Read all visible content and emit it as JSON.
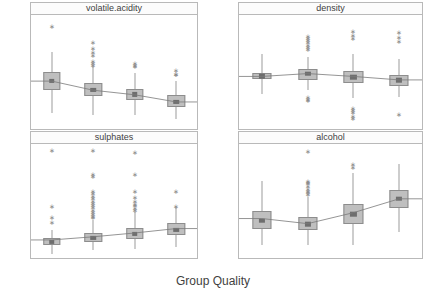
{
  "chart_data": {
    "type": "box",
    "title": "",
    "xlabel": "Group Quality",
    "ylabel": "",
    "grid": false,
    "legend": "none",
    "layout": "2x2 trellis panels",
    "categories": [
      "1",
      "2",
      "3",
      "4"
    ],
    "panels": [
      {
        "name": "volatile.acidity",
        "position": "top-left",
        "ylim": [
          0.0,
          1.75
        ],
        "yticks": [
          "1.6",
          "1.2",
          "0.8",
          "0.4",
          "0.0"
        ],
        "ytickvals": [
          1.6,
          1.2,
          0.8,
          0.4,
          0.0
        ],
        "boxes": [
          {
            "category": "1",
            "min": 0.25,
            "q1": 0.6,
            "median": 0.74,
            "q3": 0.88,
            "max": 1.18,
            "mean": 0.735,
            "outliers": [
              1.58
            ]
          },
          {
            "category": "2",
            "min": 0.22,
            "q1": 0.5,
            "median": 0.6,
            "q3": 0.7,
            "max": 0.96,
            "mean": 0.595,
            "outliers": [
              1.33,
              1.24,
              1.18,
              1.13,
              1.04,
              1.01,
              0.99
            ]
          },
          {
            "category": "3",
            "min": 0.21,
            "q1": 0.45,
            "median": 0.53,
            "q3": 0.62,
            "max": 0.86,
            "mean": 0.525,
            "outliers": [
              1.02,
              0.99,
              0.97
            ]
          },
          {
            "category": "4",
            "min": 0.16,
            "q1": 0.34,
            "median": 0.42,
            "q3": 0.52,
            "max": 0.74,
            "mean": 0.415,
            "outliers": [
              0.91,
              0.85,
              0.84
            ]
          }
        ]
      },
      {
        "name": "density",
        "position": "top-right",
        "ylim": [
          0.9885,
          1.0065
        ],
        "yticks": [
          "1.005",
          "1.000",
          "0.995",
          "0.990"
        ],
        "ytickvals": [
          1.005,
          1.0,
          0.995,
          0.99
        ],
        "boxes": [
          {
            "category": "1",
            "min": 0.99395,
            "q1": 0.9964,
            "median": 0.9968,
            "q3": 0.9974,
            "max": 1.0004,
            "mean": 0.9968,
            "outliers": []
          },
          {
            "category": "2",
            "min": 0.9946,
            "q1": 0.9962,
            "median": 0.99725,
            "q3": 0.9979,
            "max": 0.9998,
            "mean": 0.99725,
            "outliers": [
              1.0032,
              1.0029,
              1.0026,
              1.0022,
              1.0018,
              1.0015,
              1.0012,
              0.9935,
              0.9933,
              0.9931
            ]
          },
          {
            "category": "3",
            "min": 0.9934,
            "q1": 0.9958,
            "median": 0.9967,
            "q3": 0.9977,
            "max": 1.0004,
            "mean": 0.9968,
            "outliers": [
              1.004,
              1.0034,
              1.0029,
              0.9918,
              0.9915,
              0.9912,
              0.9906,
              0.9903
            ]
          },
          {
            "category": "4",
            "min": 0.9935,
            "q1": 0.9953,
            "median": 0.9962,
            "q3": 0.9971,
            "max": 0.9996,
            "mean": 0.99625,
            "outliers": [
              1.0038,
              1.0031,
              1.0024,
              0.9908
            ]
          }
        ]
      },
      {
        "name": "sulphates",
        "position": "bottom-left",
        "ylim": [
          0.3,
          2.1
        ],
        "yticks": [
          "2.0",
          "1.5",
          "1.0",
          "0.5"
        ],
        "ytickvals": [
          2.0,
          1.5,
          1.0,
          0.5
        ],
        "boxes": [
          {
            "category": "1",
            "min": 0.37,
            "q1": 0.51,
            "median": 0.56,
            "q3": 0.62,
            "max": 0.74,
            "mean": 0.585,
            "outliers": [
              2.0,
              1.12,
              0.95,
              0.87
            ]
          },
          {
            "category": "2",
            "min": 0.42,
            "q1": 0.55,
            "median": 0.62,
            "q3": 0.69,
            "max": 0.9,
            "mean": 0.635,
            "outliers": [
              2.0,
              1.62,
              1.59,
              1.36,
              1.33,
              1.28,
              1.24,
              1.2,
              1.17,
              1.13,
              1.1,
              1.06,
              1.03,
              0.99,
              0.96,
              0.94
            ]
          },
          {
            "category": "3",
            "min": 0.44,
            "q1": 0.6,
            "median": 0.68,
            "q3": 0.77,
            "max": 1.02,
            "mean": 0.695,
            "outliers": [
              1.98,
              1.63,
              1.36,
              1.26,
              1.2,
              1.16,
              1.13,
              1.09,
              1.06
            ]
          },
          {
            "category": "4",
            "min": 0.48,
            "q1": 0.66,
            "median": 0.75,
            "q3": 0.86,
            "max": 1.1,
            "mean": 0.765,
            "outliers": [
              1.36,
              1.12
            ]
          }
        ]
      },
      {
        "name": "alcohol",
        "position": "bottom-right",
        "ylim": [
          7.6,
          15.4
        ],
        "yticks": [
          "14",
          "12",
          "10",
          "8"
        ],
        "ytickvals": [
          14,
          12,
          10,
          8
        ],
        "boxes": [
          {
            "category": "1",
            "min": 8.5,
            "q1": 9.6,
            "median": 10.15,
            "q3": 10.85,
            "max": 12.9,
            "mean": 10.3,
            "outliers": []
          },
          {
            "category": "2",
            "min": 8.5,
            "q1": 9.5,
            "median": 9.9,
            "q3": 10.4,
            "max": 11.8,
            "mean": 9.95,
            "outliers": [
              14.9,
              12.9,
              12.8,
              12.7,
              12.5,
              12.3,
              12.2,
              12.1,
              12.0
            ]
          },
          {
            "category": "3",
            "min": 8.5,
            "q1": 9.9,
            "median": 10.6,
            "q3": 11.3,
            "max": 13.4,
            "mean": 10.7,
            "outliers": [
              14.0,
              13.8
            ]
          },
          {
            "category": "4",
            "min": 9.35,
            "q1": 11.0,
            "median": 11.65,
            "q3": 12.25,
            "max": 14.0,
            "mean": 11.65,
            "outliers": []
          }
        ]
      }
    ]
  },
  "axis": {
    "xlabel": "Group Quality"
  },
  "panel_labels": {
    "top_left": "volatile.acidity",
    "top_right": "density",
    "bottom_left": "sulphates",
    "bottom_right": "alcohol"
  },
  "colors": {
    "box_fill": "#bfbfbf",
    "box_border": "#8d8d8d",
    "median": "#6e6e6e",
    "whisker": "#9c9c9c",
    "outlier": "#8a8a8a",
    "mean_line": "#7a7a7a",
    "panel_border": "#b9b9b9",
    "strip_background": "#fcfcfc",
    "text": "#4d4d4d",
    "background": "#ffffff"
  }
}
